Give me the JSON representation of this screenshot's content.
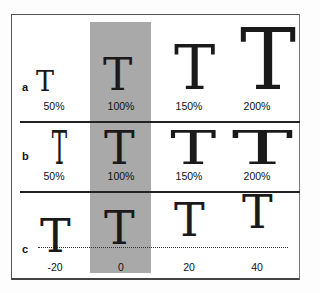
{
  "figure": {
    "background_highlight_color": "#a9a9a9",
    "rows": [
      {
        "label": "a",
        "description": "horizontal and vertical scaling",
        "items": [
          {
            "glyph": "T",
            "caption": "50%"
          },
          {
            "glyph": "T",
            "caption": "100%"
          },
          {
            "glyph": "T",
            "caption": "150%"
          },
          {
            "glyph": "T",
            "caption": "200%"
          }
        ]
      },
      {
        "label": "b",
        "description": "horizontal scaling",
        "items": [
          {
            "glyph": "T",
            "caption": "50%"
          },
          {
            "glyph": "T",
            "caption": "100%"
          },
          {
            "glyph": "T",
            "caption": "150%"
          },
          {
            "glyph": "T",
            "caption": "200%"
          }
        ]
      },
      {
        "label": "c",
        "description": "baseline shift",
        "items": [
          {
            "glyph": "T",
            "caption": "-20"
          },
          {
            "glyph": "T",
            "caption": "0"
          },
          {
            "glyph": "T",
            "caption": "20"
          },
          {
            "glyph": "T",
            "caption": "40"
          }
        ]
      }
    ]
  }
}
